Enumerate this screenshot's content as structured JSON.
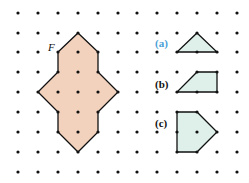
{
  "figure": {
    "grid": {
      "columns_x": [
        18,
        38,
        58,
        78,
        98,
        118,
        137,
        157,
        177,
        197,
        217,
        237
      ],
      "rows_y": [
        13,
        33,
        52,
        72,
        92,
        112,
        132,
        152,
        172
      ],
      "dot_color": "#111111",
      "dot_radius": 1.6
    },
    "main_shape": {
      "label": "F",
      "fill": "#f3d2bd",
      "stroke": "#111111",
      "points": "78,33 98,52 98,72 118,92 98,112 98,132 78,152 58,132 58,112 38,92 58,72 58,52"
    },
    "options": [
      {
        "label": "(a)",
        "color": "#4a9fd6",
        "points": "197,33 217,52 177,52"
      },
      {
        "label": "(b)",
        "color": "#111111",
        "points": "197,72 217,72 217,92 177,92"
      },
      {
        "label": "(c)",
        "color": "#111111",
        "points": "177,112 197,112 217,132 197,152 177,152"
      }
    ],
    "option_fill": "#dff0ea",
    "option_stroke": "#111111"
  }
}
